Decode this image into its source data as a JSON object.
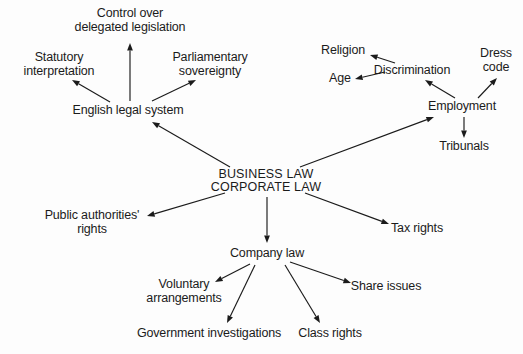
{
  "diagram": {
    "type": "mind-map",
    "colors": {
      "ink": "#1b1b1b",
      "background": "#fdfdfd"
    },
    "nodes": [
      {
        "id": "root",
        "text": "BUSINESS LAW\nCORPORATE LAW",
        "x": 266,
        "y": 180,
        "style": "root"
      },
      {
        "id": "english-legal",
        "text": "English legal system",
        "x": 128,
        "y": 111,
        "style": "plain"
      },
      {
        "id": "control",
        "text": "Control over\ndelegated legislation",
        "x": 130,
        "y": 20,
        "style": "plain"
      },
      {
        "id": "statutory",
        "text": "Statutory\ninterpretation",
        "x": 59,
        "y": 64,
        "style": "plain"
      },
      {
        "id": "parliamentary",
        "text": "Parliamentary\nsovereignty",
        "x": 210,
        "y": 64,
        "style": "plain"
      },
      {
        "id": "employment",
        "text": "Employment",
        "x": 462,
        "y": 107,
        "style": "plain"
      },
      {
        "id": "discrimination",
        "text": "Discrimination",
        "x": 412,
        "y": 71,
        "style": "plain"
      },
      {
        "id": "religion",
        "text": "Religion",
        "x": 343,
        "y": 51,
        "style": "plain"
      },
      {
        "id": "age",
        "text": "Age",
        "x": 340,
        "y": 79,
        "style": "plain"
      },
      {
        "id": "dress-code",
        "text": "Dress\ncode",
        "x": 496,
        "y": 60,
        "style": "plain"
      },
      {
        "id": "tribunals",
        "text": "Tribunals",
        "x": 464,
        "y": 147,
        "style": "plain"
      },
      {
        "id": "public-auth",
        "text": "Public authorities'\nrights",
        "x": 92,
        "y": 222,
        "style": "plain"
      },
      {
        "id": "tax-rights",
        "text": "Tax rights",
        "x": 417,
        "y": 229,
        "style": "plain"
      },
      {
        "id": "company-law",
        "text": "Company law",
        "x": 267,
        "y": 254,
        "style": "plain"
      },
      {
        "id": "voluntary",
        "text": "Voluntary\narrangements",
        "x": 184,
        "y": 291,
        "style": "plain"
      },
      {
        "id": "govt-invest",
        "text": "Government investigations",
        "x": 209,
        "y": 334,
        "style": "plain"
      },
      {
        "id": "class-rights",
        "text": "Class rights",
        "x": 330,
        "y": 334,
        "style": "plain"
      },
      {
        "id": "share-issues",
        "text": "Share issues",
        "x": 386,
        "y": 287,
        "style": "plain"
      }
    ],
    "edges": [
      {
        "from": "root",
        "to": "english-legal",
        "x1": 230,
        "y1": 167,
        "x2": 152,
        "y2": 122
      },
      {
        "from": "english-legal",
        "to": "control",
        "x1": 130,
        "y1": 101,
        "x2": 130,
        "y2": 43
      },
      {
        "from": "english-legal",
        "to": "statutory",
        "x1": 110,
        "y1": 102,
        "x2": 72,
        "y2": 80
      },
      {
        "from": "english-legal",
        "to": "parliamentary",
        "x1": 152,
        "y1": 101,
        "x2": 196,
        "y2": 80
      },
      {
        "from": "root",
        "to": "employment",
        "x1": 300,
        "y1": 167,
        "x2": 434,
        "y2": 117
      },
      {
        "from": "employment",
        "to": "discrimination",
        "x1": 455,
        "y1": 98,
        "x2": 425,
        "y2": 80
      },
      {
        "from": "discrimination",
        "to": "religion",
        "x1": 395,
        "y1": 63,
        "x2": 370,
        "y2": 55
      },
      {
        "from": "discrimination",
        "to": "age",
        "x1": 385,
        "y1": 72,
        "x2": 355,
        "y2": 79
      },
      {
        "from": "employment",
        "to": "dress-code",
        "x1": 478,
        "y1": 98,
        "x2": 497,
        "y2": 78
      },
      {
        "from": "employment",
        "to": "tribunals",
        "x1": 464,
        "y1": 117,
        "x2": 464,
        "y2": 138
      },
      {
        "from": "root",
        "to": "public-auth",
        "x1": 225,
        "y1": 193,
        "x2": 147,
        "y2": 216
      },
      {
        "from": "root",
        "to": "tax-rights",
        "x1": 305,
        "y1": 193,
        "x2": 389,
        "y2": 224
      },
      {
        "from": "root",
        "to": "company-law",
        "x1": 267,
        "y1": 197,
        "x2": 267,
        "y2": 243
      },
      {
        "from": "company-law",
        "to": "voluntary",
        "x1": 250,
        "y1": 264,
        "x2": 215,
        "y2": 282
      },
      {
        "from": "company-law",
        "to": "govt-invest",
        "x1": 255,
        "y1": 265,
        "x2": 227,
        "y2": 323
      },
      {
        "from": "company-law",
        "to": "class-rights",
        "x1": 285,
        "y1": 265,
        "x2": 320,
        "y2": 323
      },
      {
        "from": "company-law",
        "to": "share-issues",
        "x1": 290,
        "y1": 262,
        "x2": 351,
        "y2": 283
      }
    ]
  }
}
